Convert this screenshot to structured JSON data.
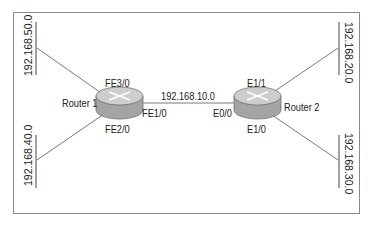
{
  "diagram": {
    "routers": [
      {
        "id": "r1",
        "label": "Router 1",
        "interfaces": {
          "top": "FE3/0",
          "right": "FE1/0",
          "bottom": "FE2/0"
        }
      },
      {
        "id": "r2",
        "label": "Router 2",
        "interfaces": {
          "top": "E1/1",
          "left": "E0/0",
          "bottom": "E1/0"
        }
      }
    ],
    "link_label": "192.168.10.0",
    "networks": {
      "top_left": "192.168.50.0",
      "bottom_left": "192.168.40.0",
      "top_right": "192.168.20.0",
      "bottom_right": "192.168.30.0"
    },
    "colors": {
      "router_body": "#a8a8a8",
      "router_top": "#cfcfcf",
      "line": "#555555",
      "border": "#8a8a8a"
    }
  }
}
